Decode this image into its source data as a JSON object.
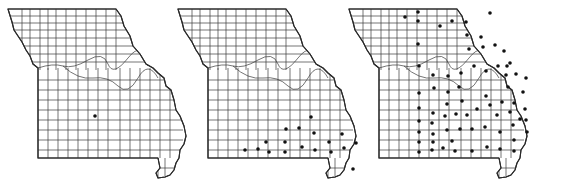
{
  "figure": {
    "description": "Three Missouri county outline maps with dots marking counties of occurrence",
    "maps": [
      {
        "id": "map-1",
        "origin": [
          8,
          8
        ],
        "dot_color": "#111111",
        "dots": [
          [
            95,
            116
          ]
        ]
      },
      {
        "id": "map-2",
        "origin": [
          178,
          8
        ],
        "dot_color": "#111111",
        "dots": [
          [
            311,
            117
          ],
          [
            286,
            129
          ],
          [
            299,
            128
          ],
          [
            314,
            133
          ],
          [
            342,
            134
          ],
          [
            266,
            142
          ],
          [
            285,
            142
          ],
          [
            329,
            142
          ],
          [
            356,
            143
          ],
          [
            374,
            143
          ],
          [
            245,
            150
          ],
          [
            258,
            149
          ],
          [
            269,
            152
          ],
          [
            285,
            152
          ],
          [
            302,
            147
          ],
          [
            315,
            150
          ],
          [
            331,
            152
          ],
          [
            344,
            148
          ],
          [
            368,
            149
          ],
          [
            353,
            169
          ],
          [
            362,
            168
          ]
        ]
      },
      {
        "id": "map-3",
        "origin": [
          349,
          8
        ],
        "dot_color": "#111111",
        "dots": [
          [
            405,
            17
          ],
          [
            418,
            12
          ],
          [
            418,
            21
          ],
          [
            440,
            26
          ],
          [
            452,
            21
          ],
          [
            466,
            22
          ],
          [
            490,
            13
          ],
          [
            467,
            35
          ],
          [
            481,
            37
          ],
          [
            418,
            44
          ],
          [
            469,
            49
          ],
          [
            483,
            47
          ],
          [
            495,
            45
          ],
          [
            504,
            51
          ],
          [
            419,
            66
          ],
          [
            510,
            63
          ],
          [
            433,
            75
          ],
          [
            448,
            76
          ],
          [
            461,
            73
          ],
          [
            474,
            66
          ],
          [
            486,
            71
          ],
          [
            498,
            66
          ],
          [
            507,
            66
          ],
          [
            506,
            75
          ],
          [
            516,
            74
          ],
          [
            526,
            78
          ],
          [
            419,
            93
          ],
          [
            434,
            88
          ],
          [
            448,
            92
          ],
          [
            459,
            87
          ],
          [
            486,
            96
          ],
          [
            508,
            87
          ],
          [
            523,
            92
          ],
          [
            419,
            108
          ],
          [
            433,
            113
          ],
          [
            447,
            104
          ],
          [
            462,
            101
          ],
          [
            477,
            109
          ],
          [
            490,
            105
          ],
          [
            502,
            102
          ],
          [
            514,
            103
          ],
          [
            525,
            109
          ],
          [
            419,
            121
          ],
          [
            432,
            123
          ],
          [
            445,
            116
          ],
          [
            456,
            114
          ],
          [
            467,
            115
          ],
          [
            497,
            115
          ],
          [
            510,
            112
          ],
          [
            520,
            119
          ],
          [
            526,
            120
          ],
          [
            419,
            132
          ],
          [
            433,
            134
          ],
          [
            447,
            130
          ],
          [
            460,
            129
          ],
          [
            472,
            129
          ],
          [
            485,
            127
          ],
          [
            500,
            132
          ],
          [
            513,
            125
          ],
          [
            527,
            132
          ],
          [
            419,
            142
          ],
          [
            433,
            142
          ],
          [
            452,
            141
          ],
          [
            514,
            140
          ],
          [
            419,
            152
          ],
          [
            432,
            150
          ],
          [
            443,
            148
          ],
          [
            455,
            151
          ],
          [
            472,
            151
          ],
          [
            487,
            147
          ],
          [
            500,
            149
          ],
          [
            514,
            151
          ]
        ]
      }
    ]
  }
}
